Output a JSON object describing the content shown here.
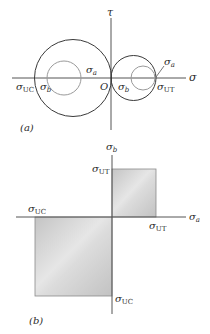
{
  "panel_a": {
    "caption": "(a)",
    "axis_x_label": "σ",
    "axis_y_label": "τ",
    "origin_label": "O",
    "labels": {
      "sigma_uc": {
        "main": "σ",
        "sub": "UC"
      },
      "sigma_b_left": {
        "main": "σ",
        "sub": "b"
      },
      "sigma_a_left": {
        "main": "σ",
        "sub": "a"
      },
      "sigma_b_right": {
        "main": "σ",
        "sub": "b"
      },
      "sigma_ut": {
        "main": "σ",
        "sub": "UT"
      },
      "sigma_a_right": {
        "main": "σ",
        "sub": "a"
      }
    },
    "colors": {
      "outer_circle": "#3a3a3a",
      "inner_circle": "#9a9a9a",
      "axis": "#555555"
    }
  },
  "panel_b": {
    "caption": "(b)",
    "axis_x_label": {
      "main": "σ",
      "sub": "a"
    },
    "axis_y_label": {
      "main": "σ",
      "sub": "b"
    },
    "labels": {
      "sigma_ut_y": {
        "main": "σ",
        "sub": "UT"
      },
      "sigma_ut_x": {
        "main": "σ",
        "sub": "UT"
      },
      "sigma_uc_x": {
        "main": "σ",
        "sub": "UC"
      },
      "sigma_uc_y": {
        "main": "σ",
        "sub": "UC"
      }
    },
    "colors": {
      "fill_light": "#e2e2e2",
      "fill_dark": "#bdbdbd",
      "border": "#8a8a8a",
      "axis": "#555555"
    }
  }
}
